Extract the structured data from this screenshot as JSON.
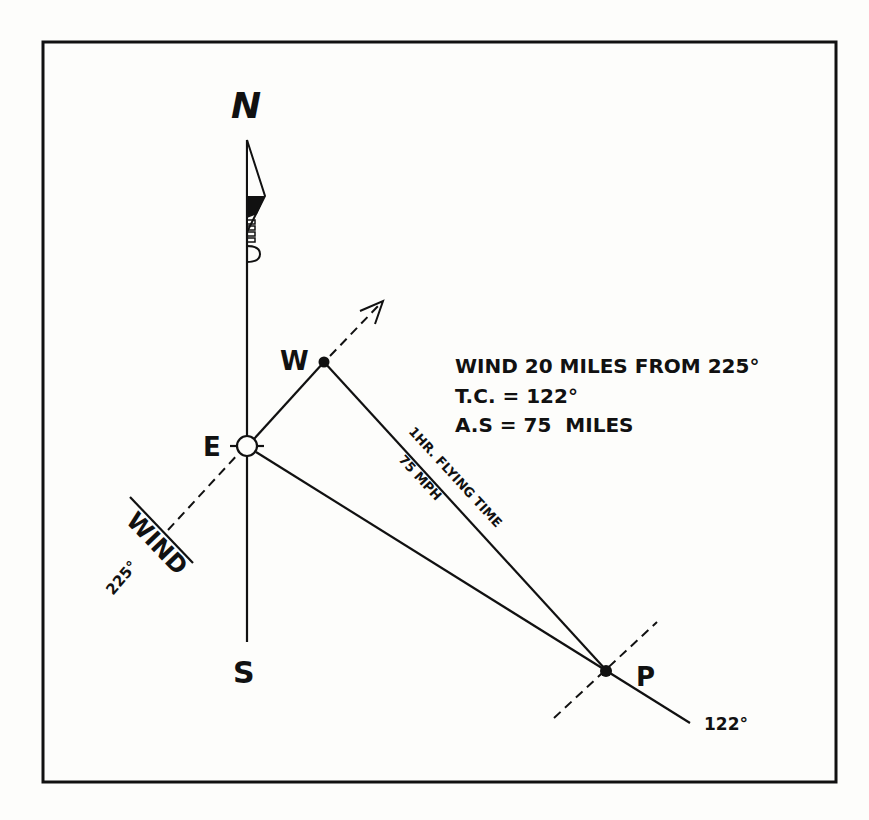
{
  "diagram": {
    "type": "wind-triangle navigation diagram",
    "compass": {
      "north_label": "N",
      "south_label": "S"
    },
    "points": {
      "E": {
        "label": "E",
        "description": "start point (open circle)"
      },
      "W": {
        "label": "W",
        "description": "wind vector end (filled dot)"
      },
      "P": {
        "label": "P",
        "description": "position after 1 hr (filled dot)"
      }
    },
    "wind_marker": {
      "label": "WIND",
      "bearing_label": "225°"
    },
    "track_end_label": "122°",
    "air_vector_labels": {
      "upper": "1HR. FLYING TIME",
      "lower": "75 MPH"
    },
    "info_block": {
      "line1": "WIND 20 MILES FROM 225°",
      "line2": "T.C. = 122°",
      "line3": "A.S = 75  MILES"
    },
    "colors": {
      "ink": "#111111",
      "paper": "#fdfdfb"
    }
  }
}
